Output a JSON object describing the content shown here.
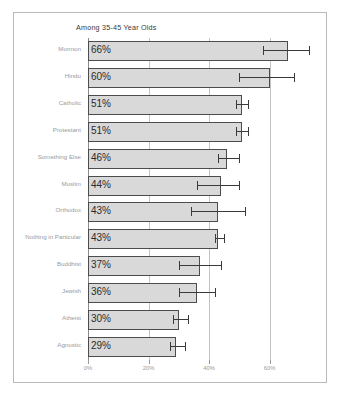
{
  "chart_data": {
    "type": "bar",
    "orientation": "horizontal",
    "title": "Among 35-45 Year Olds",
    "xlabel": "",
    "ylabel": "",
    "xlim": [
      0,
      78
    ],
    "xticks": [
      "0%",
      "20%",
      "40%",
      "60%"
    ],
    "xtick_values": [
      0,
      20,
      40,
      60
    ],
    "grid": true,
    "grid_axis": "x",
    "legend": false,
    "value_label_suffix": "%",
    "categories": [
      "Mormon",
      "Hindu",
      "Catholic",
      "Protestant",
      "Something Else",
      "Muslim",
      "Orthodox",
      "Nothing in Particular",
      "Buddhist",
      "Jewish",
      "Atheist",
      "Agnostic"
    ],
    "values": [
      66,
      60,
      51,
      51,
      46,
      44,
      43,
      43,
      37,
      36,
      30,
      29
    ],
    "value_labels": [
      "66%",
      "60%",
      "51%",
      "51%",
      "46%",
      "44%",
      "43%",
      "43%",
      "37%",
      "36%",
      "30%",
      "29%"
    ],
    "error_bars": [
      {
        "category": "Mormon",
        "low": 58,
        "high": 73
      },
      {
        "category": "Hindu",
        "low": 50,
        "high": 68
      },
      {
        "category": "Catholic",
        "low": 49,
        "high": 53
      },
      {
        "category": "Protestant",
        "low": 49,
        "high": 53
      },
      {
        "category": "Something Else",
        "low": 43,
        "high": 50
      },
      {
        "category": "Muslim",
        "low": 36,
        "high": 50
      },
      {
        "category": "Orthodox",
        "low": 34,
        "high": 52
      },
      {
        "category": "Nothing in Particular",
        "low": 42,
        "high": 45
      },
      {
        "category": "Buddhist",
        "low": 30,
        "high": 44
      },
      {
        "category": "Jewish",
        "low": 30,
        "high": 42
      },
      {
        "category": "Atheist",
        "low": 28,
        "high": 33
      },
      {
        "category": "Agnostic",
        "low": 27,
        "high": 32
      }
    ],
    "colors": {
      "bar_fill": "#d9d9d9",
      "bar_border": "#4c4c4c",
      "error_bar": "#3a3a3a",
      "grid": "#c4c4c4",
      "axis": "#8a8a8a",
      "category_label": "#9a9a9a",
      "value_label": "#2b2b2b",
      "title": "#3a3a3a",
      "frame": "#b9b9b9",
      "background": "#ffffff"
    }
  }
}
